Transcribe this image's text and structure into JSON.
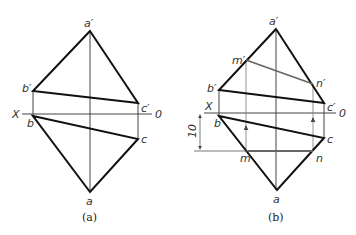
{
  "figure": {
    "panels": [
      {
        "id": "a",
        "caption": "(a)",
        "axis_labels": {
          "x": "X",
          "o": "0"
        },
        "points": {
          "a_prime": "a′",
          "b_prime": "b′",
          "c_prime": "c′",
          "b": "b",
          "c": "c",
          "a": "a"
        }
      },
      {
        "id": "b",
        "caption": "(b)",
        "axis_labels": {
          "x": "X",
          "o": "0"
        },
        "points": {
          "a_prime": "a′",
          "b_prime": "b′",
          "c_prime": "c′",
          "m_prime": "m′",
          "n_prime": "n′",
          "b": "b",
          "c": "c",
          "m": "m",
          "n": "n",
          "a": "a"
        },
        "dimension": "10"
      }
    ],
    "colors": {
      "outline": "#111111",
      "projection": "#555555",
      "highlight": "#666666"
    }
  }
}
